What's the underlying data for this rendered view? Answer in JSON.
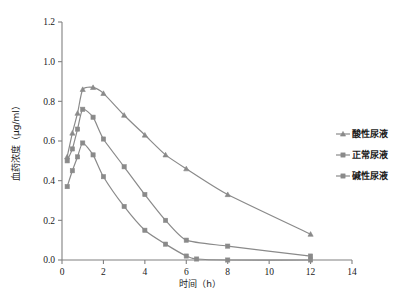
{
  "chart_data": {
    "type": "line",
    "title": "",
    "xlabel": "时间（h）",
    "ylabel": "血药浓度（μg/ml）",
    "xlim": [
      0,
      14
    ],
    "ylim": [
      0.0,
      1.2
    ],
    "xticks": [
      0,
      2,
      4,
      6,
      8,
      10,
      12,
      14
    ],
    "xticklabels": [
      "0",
      "2",
      "4",
      "6",
      "8",
      "10",
      "12",
      "14"
    ],
    "yticks": [
      0.0,
      0.2,
      0.4,
      0.6,
      0.8,
      1.0,
      1.2
    ],
    "yticklabels": [
      "0.0",
      "0.2",
      "0.4",
      "0.6",
      "0.8",
      "1.0",
      "1.2"
    ],
    "grid": false,
    "legend_position": "right",
    "line_color": "#8a8a8a",
    "series": [
      {
        "name": "酸性尿液",
        "marker": "triangle",
        "x": [
          0.25,
          0.5,
          0.75,
          1.0,
          1.5,
          2.0,
          3.0,
          4.0,
          5.0,
          6.0,
          8.0,
          12.0
        ],
        "values": [
          0.52,
          0.64,
          0.74,
          0.86,
          0.87,
          0.84,
          0.73,
          0.63,
          0.53,
          0.46,
          0.33,
          0.13
        ]
      },
      {
        "name": "正常尿液",
        "marker": "square",
        "x": [
          0.25,
          0.5,
          0.75,
          1.0,
          1.5,
          2.0,
          3.0,
          4.0,
          5.0,
          6.0,
          8.0,
          12.0
        ],
        "values": [
          0.5,
          0.56,
          0.66,
          0.76,
          0.72,
          0.61,
          0.47,
          0.33,
          0.2,
          0.1,
          0.07,
          0.02
        ]
      },
      {
        "name": "碱性尿液",
        "marker": "square",
        "x": [
          0.25,
          0.5,
          0.75,
          1.0,
          1.5,
          2.0,
          3.0,
          4.0,
          5.0,
          6.0,
          6.5,
          8.0,
          12.0
        ],
        "values": [
          0.37,
          0.45,
          0.52,
          0.59,
          0.53,
          0.42,
          0.27,
          0.15,
          0.08,
          0.02,
          0.005,
          0.0,
          0.0
        ]
      }
    ]
  },
  "legend": {
    "items": [
      {
        "label": "酸性尿液"
      },
      {
        "label": "正常尿液"
      },
      {
        "label": "碱性尿液"
      }
    ]
  }
}
